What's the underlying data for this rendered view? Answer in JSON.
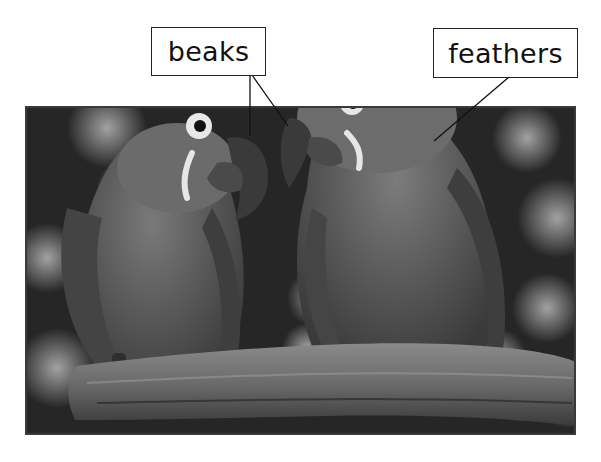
{
  "labels": {
    "beaks": "beaks",
    "feathers": "feathers"
  },
  "photo": {
    "subject": "two parrots perched on a branch",
    "colors": {
      "background_dark": "#262626",
      "bokeh_light": "#9a9a9a",
      "bird_body": "#5a5a5a",
      "bird_head": "#6a6a6a",
      "eye_ring": "#e8e8e8",
      "beak": "#3a3a3a",
      "branch": "#6e6e6e"
    }
  },
  "pointers": {
    "beaks": [
      [
        250,
        75,
        250,
        136
      ],
      [
        252,
        75,
        288,
        126
      ]
    ],
    "feathers": [
      [
        509,
        77,
        434,
        141
      ]
    ]
  }
}
